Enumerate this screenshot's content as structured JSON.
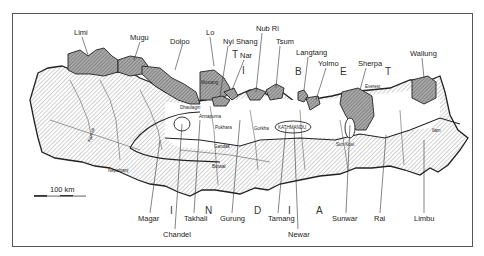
{
  "map": {
    "title": "Ethnic groups of Nepal",
    "country_labels": {
      "tibet": [
        "T",
        "I",
        "B",
        "E",
        "T"
      ],
      "india": [
        "I",
        "N",
        "D",
        "I",
        "A"
      ]
    },
    "scale_bar": {
      "label": "100 km"
    },
    "ethnic_groups_north": [
      {
        "name": "Limi"
      },
      {
        "name": "Mugu"
      },
      {
        "name": "Dolpo"
      },
      {
        "name": "Lo"
      },
      {
        "name": "Nyi Shang"
      },
      {
        "name": "Nar"
      },
      {
        "name": "Nub Ri"
      },
      {
        "name": "Tsum"
      },
      {
        "name": "Langtang"
      },
      {
        "name": "Yolmo"
      },
      {
        "name": "Sherpa"
      },
      {
        "name": "Wallung"
      }
    ],
    "ethnic_groups_south": [
      {
        "name": "Magar"
      },
      {
        "name": "Chandel"
      },
      {
        "name": "Takhali"
      },
      {
        "name": "Gurung"
      },
      {
        "name": "Tamang"
      },
      {
        "name": "Newar"
      },
      {
        "name": "Sunwar"
      },
      {
        "name": "Rai"
      },
      {
        "name": "Limbu"
      }
    ],
    "places": [
      {
        "name": "Mustang"
      },
      {
        "name": "Dhaulagiri"
      },
      {
        "name": "Annapurna"
      },
      {
        "name": "Pokhara"
      },
      {
        "name": "Gorkha"
      },
      {
        "name": "KATHMANDU"
      },
      {
        "name": "Everest"
      },
      {
        "name": "Gandak"
      },
      {
        "name": "Butwal"
      },
      {
        "name": "Nepalganj"
      },
      {
        "name": "Karnali"
      },
      {
        "name": "Sun Kosi"
      },
      {
        "name": "Ilam"
      }
    ]
  }
}
